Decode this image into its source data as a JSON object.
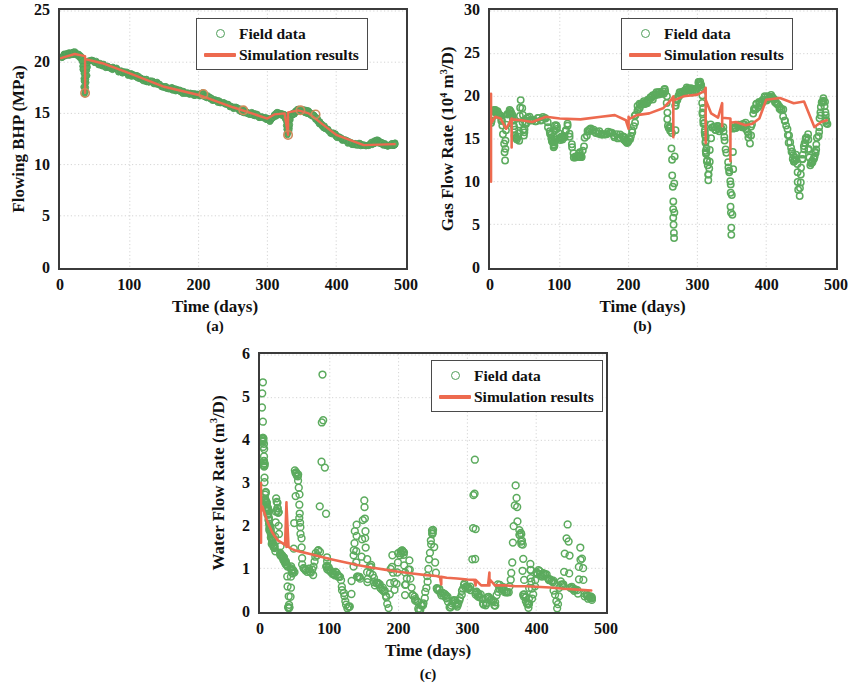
{
  "figure": {
    "panels": [
      {
        "id": "a",
        "caption": "(a)",
        "ylabel_text": "Flowing BHP (MPa)",
        "xlabel": "Time (days)",
        "legend": [
          {
            "label": "Field data",
            "marker": "open-circle",
            "color": "#4f9e5a"
          },
          {
            "label": "Simulation results",
            "marker": "line",
            "color": "#ed6a4f"
          }
        ]
      },
      {
        "id": "b",
        "caption": "(b)",
        "ylabel_prefix": "Gas Flow Rate (10",
        "ylabel_sup1": "4",
        "ylabel_mid": " m",
        "ylabel_sup2": "3",
        "ylabel_suffix": "/D)",
        "xlabel": "Time (days)",
        "legend": [
          {
            "label": "Field data",
            "marker": "open-circle",
            "color": "#4f9e5a"
          },
          {
            "label": "Simulation results",
            "marker": "line",
            "color": "#ed6a4f"
          }
        ]
      },
      {
        "id": "c",
        "caption": "(c)",
        "ylabel_prefix": "Water Flow Rate (m",
        "ylabel_sup1": "3",
        "ylabel_suffix": "/D)",
        "xlabel": "Time (days)",
        "legend": [
          {
            "label": "Field data",
            "marker": "open-circle",
            "color": "#4f9e5a"
          },
          {
            "label": "Simulation results",
            "marker": "line",
            "color": "#ed6a4f"
          }
        ]
      }
    ]
  },
  "chart_data": [
    {
      "type": "scatter",
      "panel": "a",
      "title": "(a) Flowing Bottom Hole Pressure history match",
      "xlabel": "Time (days)",
      "ylabel": "Flowing BHP (MPa)",
      "xlim": [
        0,
        500
      ],
      "ylim": [
        0,
        25
      ],
      "xticks": [
        0,
        100,
        200,
        300,
        400,
        500
      ],
      "yticks": [
        0,
        5,
        10,
        15,
        20,
        25
      ],
      "grid": true,
      "legend_position": "top-right",
      "series": [
        {
          "name": "Field data",
          "marker": "open-circle",
          "color": "#4f9e5a",
          "x": [
            0,
            5,
            10,
            15,
            20,
            25,
            30,
            35,
            40,
            50,
            60,
            70,
            80,
            90,
            100,
            110,
            120,
            130,
            140,
            150,
            160,
            170,
            180,
            190,
            200,
            205,
            210,
            220,
            230,
            240,
            250,
            258,
            262,
            266,
            270,
            280,
            290,
            300,
            305,
            310,
            315,
            320,
            325,
            330,
            335,
            340,
            345,
            350,
            355,
            360,
            365,
            370,
            375,
            380,
            390,
            400,
            410,
            420,
            430,
            440,
            450,
            455,
            460,
            465,
            470,
            475,
            480,
            485
          ],
          "y": [
            20.5,
            20.7,
            20.8,
            20.8,
            20.9,
            20.7,
            20.4,
            16.9,
            20.2,
            20.0,
            19.7,
            19.5,
            19.3,
            19.0,
            18.8,
            18.6,
            18.3,
            18.1,
            17.9,
            17.6,
            17.4,
            17.2,
            17.0,
            16.9,
            16.8,
            16.9,
            16.7,
            16.4,
            16.1,
            15.9,
            15.6,
            15.4,
            15.3,
            15.2,
            15.1,
            14.9,
            14.7,
            14.5,
            14.3,
            14.8,
            15.0,
            14.9,
            14.8,
            12.9,
            14.9,
            15.1,
            15.3,
            15.3,
            15.2,
            15.1,
            14.9,
            14.6,
            14.2,
            13.8,
            13.2,
            12.8,
            12.4,
            12.1,
            12.0,
            11.9,
            12.0,
            12.2,
            12.3,
            12.1,
            12.0,
            11.9,
            11.9,
            12.0
          ]
        },
        {
          "name": "Simulation results",
          "marker": "line",
          "color": "#ed6a4f",
          "x": [
            0,
            20,
            35,
            35,
            35,
            60,
            100,
            150,
            200,
            250,
            300,
            310,
            325,
            330,
            330,
            330,
            345,
            360,
            400,
            440,
            485
          ],
          "y": [
            20.4,
            20.8,
            20.6,
            17.0,
            20.3,
            19.9,
            18.9,
            17.6,
            16.8,
            15.6,
            14.5,
            14.9,
            15.0,
            12.9,
            14.9,
            15.1,
            15.3,
            15.0,
            12.9,
            11.9,
            12.0
          ]
        }
      ]
    },
    {
      "type": "scatter",
      "panel": "b",
      "title": "(b) Gas flow rate history match",
      "xlabel": "Time (days)",
      "ylabel": "Gas Flow Rate (10^4 m^3/D)",
      "xlim": [
        0,
        500
      ],
      "ylim": [
        0,
        30
      ],
      "xticks": [
        0,
        100,
        200,
        300,
        400,
        500
      ],
      "yticks": [
        0,
        5,
        10,
        15,
        20,
        25,
        30
      ],
      "grid": true,
      "legend_position": "top-right",
      "series": [
        {
          "name": "Field data",
          "marker": "open-circle",
          "color": "#4f9e5a",
          "x": [
            0,
            4,
            8,
            12,
            16,
            20,
            24,
            28,
            32,
            36,
            40,
            44,
            48,
            52,
            60,
            70,
            80,
            88,
            90,
            92,
            94,
            100,
            106,
            112,
            120,
            126,
            128,
            130,
            132,
            140,
            150,
            160,
            170,
            180,
            190,
            196,
            200,
            206,
            212,
            218,
            224,
            230,
            236,
            242,
            248,
            254,
            258,
            262,
            264,
            266,
            268,
            272,
            278,
            284,
            290,
            296,
            302,
            306,
            308,
            310,
            312,
            314,
            316,
            320,
            326,
            332,
            338,
            344,
            348,
            350,
            352,
            358,
            364,
            370,
            376,
            382,
            388,
            394,
            400,
            406,
            412,
            418,
            424,
            430,
            436,
            440,
            444,
            448,
            452,
            456,
            460,
            464,
            468,
            472,
            476,
            480,
            484,
            488
          ],
          "y": [
            16.8,
            18.2,
            18.3,
            17.6,
            17.3,
            12.5,
            17.9,
            18.2,
            17.6,
            15.2,
            15.0,
            19.3,
            15.1,
            17.5,
            17.3,
            17.4,
            17.5,
            15.3,
            14.6,
            14.0,
            16.9,
            15.0,
            15.1,
            16.6,
            13.1,
            13.0,
            13.1,
            13.2,
            13.0,
            16.1,
            16.0,
            15.8,
            15.6,
            15.4,
            15.2,
            14.8,
            14.7,
            16.0,
            18.5,
            19.2,
            19.4,
            19.6,
            20.0,
            20.3,
            20.5,
            20.7,
            16.6,
            15.8,
            7.5,
            3.3,
            19.0,
            20.0,
            20.6,
            20.9,
            20.8,
            20.6,
            21.5,
            21.6,
            18.0,
            16.3,
            14.5,
            12.8,
            10.0,
            16.4,
            16.3,
            16.2,
            16.1,
            12.5,
            9.7,
            3.7,
            16.3,
            16.4,
            16.5,
            16.8,
            14.6,
            18.6,
            19.0,
            19.4,
            19.8,
            20.0,
            19.6,
            19.0,
            18.2,
            16.0,
            14.0,
            12.2,
            13.0,
            8.2,
            12.5,
            14.3,
            15.4,
            12.2,
            12.5,
            13.4,
            16.0,
            18.8,
            19.8,
            17.0
          ]
        },
        {
          "name": "Simulation results",
          "marker": "line",
          "color": "#ed6a4f",
          "x": [
            0,
            0,
            0,
            6,
            14,
            22,
            30,
            30,
            30,
            44,
            60,
            80,
            100,
            130,
            160,
            180,
            196,
            200,
            200,
            200,
            212,
            230,
            250,
            262,
            265,
            265,
            265,
            280,
            300,
            310,
            312,
            312,
            312,
            320,
            330,
            336,
            336,
            336,
            348,
            348,
            348,
            356,
            370,
            380,
            390,
            400,
            420,
            440,
            455,
            470,
            480,
            488
          ],
          "y": [
            10.0,
            20.3,
            16.8,
            17.6,
            17.4,
            16.2,
            17.4,
            14.0,
            17.3,
            17.2,
            17.0,
            17.6,
            17.4,
            17.3,
            17.6,
            17.8,
            17.2,
            16.2,
            17.6,
            17.3,
            17.8,
            18.0,
            18.6,
            19.6,
            20.0,
            15.2,
            19.5,
            20.0,
            20.2,
            20.6,
            21.0,
            14.5,
            19.6,
            18.0,
            17.5,
            19.2,
            16.5,
            17.5,
            17.4,
            12.4,
            16.9,
            17.0,
            16.6,
            16.8,
            17.4,
            19.6,
            19.8,
            19.2,
            19.4,
            16.4,
            17.0,
            17.2
          ]
        }
      ]
    },
    {
      "type": "scatter",
      "panel": "c",
      "title": "(c) Water flow rate history match",
      "xlabel": "Time (days)",
      "ylabel": "Water Flow Rate (m^3/D)",
      "xlim": [
        0,
        500
      ],
      "ylim": [
        0,
        6
      ],
      "xticks": [
        0,
        100,
        200,
        300,
        400,
        500
      ],
      "yticks": [
        0,
        1,
        2,
        3,
        4,
        5,
        6
      ],
      "grid": true,
      "legend_position": "top-right",
      "series": [
        {
          "name": "Field data",
          "marker": "open-circle",
          "color": "#4f9e5a",
          "x": [
            2,
            2,
            3,
            4,
            4,
            5,
            6,
            6,
            7,
            8,
            9,
            10,
            11,
            12,
            13,
            14,
            15,
            16,
            18,
            20,
            22,
            24,
            26,
            28,
            30,
            32,
            34,
            36,
            38,
            40,
            42,
            44,
            46,
            48,
            50,
            52,
            54,
            56,
            58,
            60,
            65,
            70,
            75,
            80,
            85,
            90,
            95,
            96,
            100,
            105,
            110,
            115,
            120,
            125,
            130,
            135,
            138,
            140,
            145,
            150,
            152,
            155,
            160,
            165,
            170,
            175,
            180,
            185,
            190,
            195,
            200,
            205,
            208,
            210,
            215,
            220,
            225,
            230,
            235,
            240,
            245,
            248,
            250,
            255,
            260,
            265,
            270,
            275,
            280,
            285,
            290,
            295,
            300,
            305,
            310,
            312,
            315,
            320,
            325,
            330,
            335,
            340,
            345,
            350,
            355,
            360,
            365,
            370,
            375,
            378,
            380,
            382,
            385,
            388,
            390,
            392,
            395,
            400,
            405,
            410,
            415,
            420,
            425,
            430,
            435,
            440,
            445,
            450,
            455,
            460,
            465,
            470,
            475,
            480
          ],
          "y": [
            5.4,
            4.05,
            4.0,
            3.9,
            3.45,
            3.5,
            2.8,
            2.55,
            2.6,
            2.45,
            2.3,
            2.45,
            2.2,
            2.0,
            1.95,
            1.9,
            1.7,
            1.6,
            1.5,
            1.45,
            2.6,
            2.4,
            2.25,
            1.35,
            1.3,
            1.25,
            1.2,
            1.15,
            1.1,
            0.05,
            0.1,
            1.0,
            0.95,
            0.9,
            3.3,
            3.25,
            3.1,
            2.3,
            1.85,
            1.05,
            1.0,
            0.95,
            0.9,
            1.35,
            1.4,
            5.5,
            1.2,
            1.0,
            0.95,
            0.9,
            0.85,
            0.8,
            0.45,
            0.05,
            0.1,
            1.3,
            2.0,
            0.8,
            0.75,
            2.6,
            1.7,
            0.7,
            1.1,
            0.65,
            0.6,
            0.55,
            0.5,
            0.05,
            1.25,
            0.45,
            1.35,
            1.4,
            1.3,
            0.4,
            1.2,
            0.35,
            0.3,
            0.05,
            0.1,
            0.55,
            1.2,
            1.85,
            1.85,
            0.5,
            0.45,
            0.4,
            0.35,
            0.05,
            0.3,
            0.1,
            0.25,
            0.6,
            0.55,
            0.5,
            3.5,
            0.45,
            0.4,
            0.35,
            0.05,
            0.3,
            0.25,
            0.1,
            0.6,
            0.55,
            0.5,
            0.45,
            1.1,
            2.95,
            1.85,
            1.75,
            1.5,
            0.4,
            0.35,
            0.05,
            0.3,
            1.15,
            0.25,
            0.95,
            0.9,
            0.85,
            0.8,
            0.75,
            0.7,
            0.05,
            0.65,
            0.6,
            2.05,
            0.55,
            0.5,
            0.45,
            1.5,
            0.4,
            0.35,
            0.3
          ]
        },
        {
          "name": "Simulation results",
          "marker": "line",
          "color": "#ed6a4f",
          "x": [
            0,
            0,
            0,
            2,
            5,
            8,
            12,
            16,
            20,
            25,
            30,
            35,
            37,
            37,
            37,
            40,
            45,
            50,
            60,
            70,
            80,
            90,
            100,
            120,
            140,
            160,
            180,
            200,
            220,
            240,
            255,
            260,
            262,
            262,
            270,
            285,
            300,
            310,
            312,
            312,
            320,
            330,
            332,
            332,
            332,
            340,
            355,
            370,
            385,
            400,
            420,
            440,
            460,
            480
          ],
          "y": [
            1.6,
            3.0,
            2.4,
            2.45,
            2.3,
            2.15,
            2.0,
            1.85,
            1.75,
            1.65,
            1.6,
            1.55,
            2.55,
            1.5,
            2.5,
            1.5,
            1.45,
            1.42,
            1.38,
            1.34,
            1.3,
            1.26,
            1.22,
            1.15,
            1.08,
            1.02,
            0.97,
            0.92,
            0.88,
            0.84,
            0.82,
            0.8,
            0.62,
            0.8,
            0.78,
            0.76,
            0.74,
            0.73,
            0.6,
            0.73,
            0.6,
            0.6,
            0.9,
            0.6,
            0.75,
            0.6,
            0.6,
            0.58,
            0.58,
            0.57,
            0.55,
            0.52,
            0.5,
            0.48
          ]
        }
      ]
    }
  ]
}
